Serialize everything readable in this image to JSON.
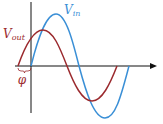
{
  "diagram": {
    "type": "phase-shift-sinusoids",
    "labels": {
      "vin": {
        "main": "V",
        "sub": "in"
      },
      "vout": {
        "main": "V",
        "sub": "out"
      },
      "phase": "φ"
    },
    "colors": {
      "vin": "#3a8fd6",
      "vout": "#9b2a2e",
      "axis": "#111111",
      "phase_label": "#9b2a2e"
    },
    "series": [
      {
        "name": "Vin",
        "amplitude": 1.0,
        "phase_offset": 0
      },
      {
        "name": "Vout",
        "amplitude": 0.67,
        "phase_offset": "leads by φ"
      }
    ]
  }
}
